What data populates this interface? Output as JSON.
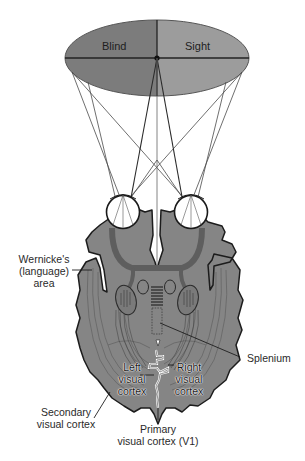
{
  "diagram": {
    "title": "",
    "colors": {
      "blind_field": "#7c7c7c",
      "sight_field": "#9c9c9c",
      "brain_fill": "#858585",
      "brain_outline": "#1c1c1c",
      "pathway": "#5e5e5e",
      "eye_fill": "#ffffff",
      "lines": "#3a3a3a",
      "background": "#ffffff"
    },
    "visual_field": {
      "left_label": "Blind",
      "right_label": "Sight"
    },
    "labels": {
      "wernicke_line1": "Wernicke's",
      "wernicke_line2": "(language)",
      "wernicke_line3": "area",
      "splenium": "Splenium",
      "left_vc_line1": "Left",
      "left_vc_line2": "visual",
      "left_vc_line3": "cortex",
      "right_vc_line1": "Right",
      "right_vc_line2": "visual",
      "right_vc_line3": "cortex",
      "secondary_line1": "Secondary",
      "secondary_line2": "visual cortex",
      "primary_line1": "Primary",
      "primary_line2": "visual cortex (V1)"
    },
    "nodes": [
      {
        "id": "visual-field",
        "label": "Blind / Sight"
      },
      {
        "id": "left-eye",
        "label": ""
      },
      {
        "id": "right-eye",
        "label": ""
      },
      {
        "id": "wernicke",
        "label": "Wernicke's (language) area"
      },
      {
        "id": "splenium",
        "label": "Splenium"
      },
      {
        "id": "left-visual-cortex",
        "label": "Left visual cortex"
      },
      {
        "id": "right-visual-cortex",
        "label": "Right visual cortex"
      },
      {
        "id": "secondary-visual-cortex",
        "label": "Secondary visual cortex"
      },
      {
        "id": "primary-visual-cortex",
        "label": "Primary visual cortex (V1)"
      }
    ]
  }
}
